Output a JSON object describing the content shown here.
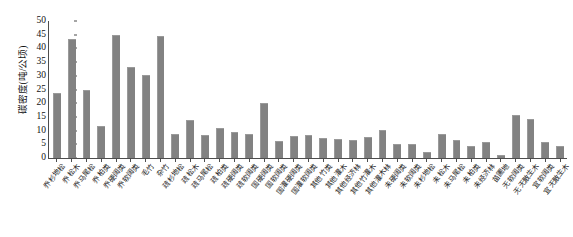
{
  "chart_data": {
    "type": "bar",
    "title": "",
    "subtitle": "",
    "xlabel": "",
    "ylabel": "碳密度(吨/公顷)",
    "ylim": [
      0,
      50
    ],
    "yticks": [
      0,
      5,
      10,
      15,
      20,
      25,
      30,
      35,
      40,
      45,
      50
    ],
    "grid": false,
    "legend": false,
    "legend_position": "none",
    "bar_color": "#828282",
    "axis_color": "#4d4d4d",
    "categories": [
      "乔 杉地松",
      "乔 松木",
      "乔 马尾松",
      "乔 柏类",
      "乔 硬阔类",
      "乔 软阔类",
      "毛竹",
      "杂竹",
      "疏 杉地松",
      "疏 松木",
      "疏 马尾松",
      "疏 柏类",
      "疏 硬阔类",
      "疏 软阔类",
      "国 硬阔类",
      "国 软阔类",
      "国灌 硬阔类",
      "国灌 软阔类",
      "其他 竹类",
      "其他 灌木",
      "其他 经济林",
      "其他 竹灌木",
      "其他 灌木林",
      "未 硬阔类",
      "未 软阔类",
      "未 杉地松",
      "未 松木",
      "未 马尾松",
      "未 柏类",
      "未 经济林",
      "苗圃地",
      "无 软阔类",
      "无 无散生木",
      "宜 软阔类",
      "宜 无散生木"
    ],
    "values": [
      23.4,
      43.0,
      24.3,
      11.5,
      44.5,
      32.9,
      30.0,
      44.0,
      8.3,
      13.6,
      8.1,
      10.7,
      9.0,
      8.5,
      19.8,
      6.0,
      7.8,
      8.2,
      6.8,
      6.6,
      6.3,
      7.2,
      9.7,
      4.6,
      4.7,
      2.0,
      8.4,
      6.1,
      4.0,
      5.6,
      0.8,
      15.3,
      13.8,
      5.3,
      4.2
    ]
  }
}
